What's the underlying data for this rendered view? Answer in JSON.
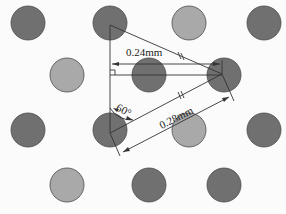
{
  "diagram": {
    "type": "hexagonal hole array geometry",
    "colors": {
      "dark": "#707070",
      "light": "#a9a9a9",
      "stroke": "#4a4a4a",
      "line": "#333333"
    },
    "radius": 17,
    "circles": [
      {
        "x": 28,
        "y": 23,
        "shade": "dark"
      },
      {
        "x": 110,
        "y": 23,
        "shade": "dark"
      },
      {
        "x": 189,
        "y": 23,
        "shade": "light"
      },
      {
        "x": 264,
        "y": 23,
        "shade": "dark"
      },
      {
        "x": 67,
        "y": 75,
        "shade": "light"
      },
      {
        "x": 149,
        "y": 75,
        "shade": "dark"
      },
      {
        "x": 224,
        "y": 75,
        "shade": "dark"
      },
      {
        "x": 28,
        "y": 130,
        "shade": "dark"
      },
      {
        "x": 110,
        "y": 130,
        "shade": "dark"
      },
      {
        "x": 189,
        "y": 130,
        "shade": "light"
      },
      {
        "x": 264,
        "y": 130,
        "shade": "dark"
      },
      {
        "x": 67,
        "y": 185,
        "shade": "light"
      },
      {
        "x": 149,
        "y": 185,
        "shade": "dark"
      },
      {
        "x": 224,
        "y": 185,
        "shade": "dark"
      }
    ],
    "labels": {
      "horizontal_spacing": "0.24mm",
      "pitch": "0.28mm",
      "angle": "60°"
    }
  }
}
